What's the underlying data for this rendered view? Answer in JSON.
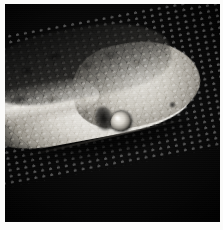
{
  "image": {
    "kind": "photograph",
    "subject": "snake-head",
    "caption": "Close-up photograph of a snake's head in left profile against a black background",
    "orientation": "facing right",
    "width_px": 223,
    "height_px": 230,
    "background_color": "#000000",
    "border_color": "#fbfbfa",
    "border_width_px": 4,
    "photo": {
      "left_px": 5,
      "top_px": 4,
      "width_px": 215,
      "height_px": 218
    }
  },
  "palette": {
    "backdrop_black": "#000000",
    "backdrop_near_black": "#0a0a0a",
    "scale_highlight_white": "#ffffff",
    "scale_light": "#f2f0eb",
    "scale_mid_gray": "#a6a29a",
    "scale_dark_gray": "#3a3935",
    "blotch_black": "#0a0a0a",
    "paper_margin": "#fbfbfa"
  },
  "regions": [
    {
      "name": "dorsal-blotches",
      "label": "Dark dorsal blotched scales",
      "tone": "dark",
      "hex": "#15151 4"
    },
    {
      "name": "lower-jaw",
      "label": "Pale white lower jaw and labial scales",
      "tone": "bright",
      "hex": "#f4f3f0"
    },
    {
      "name": "snout",
      "label": "Snout and rostral scales",
      "tone": "mid",
      "hex": "#cdcac2"
    },
    {
      "name": "eye",
      "label": "Eye",
      "tone": "mid-bright",
      "hex": "#d6d2ca"
    },
    {
      "name": "neck",
      "label": "Pale neck band",
      "tone": "bright",
      "hex": "#e8e5dd"
    }
  ]
}
